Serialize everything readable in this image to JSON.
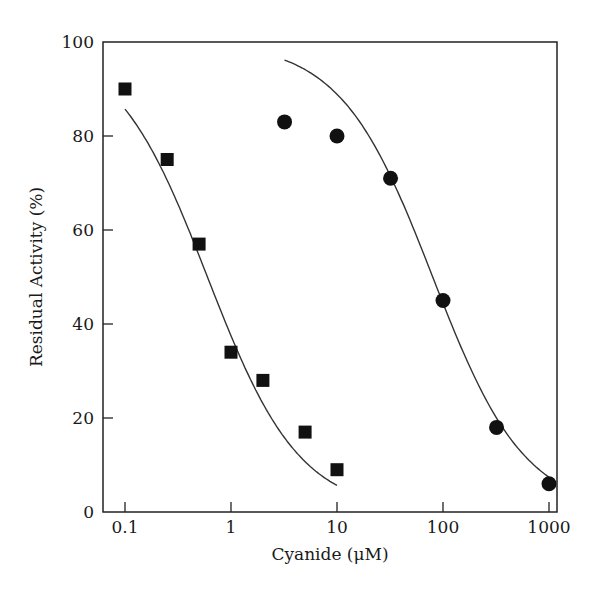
{
  "chart_data": {
    "type": "scatter",
    "title": "",
    "xlabel": "Cyanide (μM)",
    "ylabel": "Residual Activity (%)",
    "xscale": "log",
    "xlim": [
      0.08,
      1200
    ],
    "ylim": [
      0,
      100
    ],
    "xticks": [
      0.1,
      1,
      10,
      100,
      1000
    ],
    "xtick_labels": [
      "0.1",
      "1",
      "10",
      "100",
      "1000"
    ],
    "yticks": [
      0,
      20,
      40,
      60,
      80,
      100
    ],
    "ytick_labels": [
      "0",
      "20",
      "40",
      "60",
      "80",
      "100"
    ],
    "grid": false,
    "legend": null,
    "series": [
      {
        "name": "squares",
        "marker": "square",
        "x": [
          0.1,
          0.25,
          0.5,
          1,
          2,
          5,
          10
        ],
        "y": [
          90,
          75,
          57,
          34,
          28,
          17,
          9
        ],
        "fit_curve": {
          "model": "sigmoid",
          "x_range": [
            0.1,
            10
          ],
          "ic50": 0.6,
          "top": 100,
          "bottom": 0,
          "hill": 1
        }
      },
      {
        "name": "circles",
        "marker": "circle",
        "x": [
          3.2,
          10,
          32,
          100,
          320,
          1000
        ],
        "y": [
          83,
          80,
          71,
          45,
          18,
          6
        ],
        "fit_curve": {
          "model": "sigmoid",
          "x_range": [
            3.2,
            1000
          ],
          "ic50": 80,
          "top": 100,
          "bottom": 0,
          "hill": 1
        }
      }
    ]
  }
}
